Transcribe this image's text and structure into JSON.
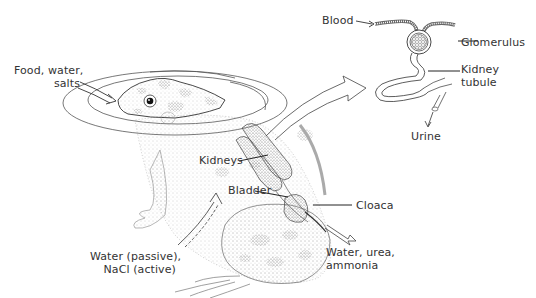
{
  "diagram": {
    "labels": {
      "food_water_salts_line1": "Food, water,",
      "food_water_salts_line2": "salts",
      "kidneys": "Kidneys",
      "bladder": "Bladder",
      "cloaca": "Cloaca",
      "water_passive_line1": "Water (passive),",
      "water_passive_line2": "NaCl (active)",
      "water_urea_line1": "Water, urea,",
      "water_urea_line2": "ammonia",
      "blood": "Blood",
      "glomerulus": "Glomerulus",
      "kidney_tubule_line1": "Kidney",
      "kidney_tubule_line2": "tubule",
      "urine": "Urine"
    },
    "colors": {
      "ink": "#333333",
      "spot": "#9a9a9a",
      "stipple": "#b5b5b5",
      "background": "#ffffff"
    }
  }
}
